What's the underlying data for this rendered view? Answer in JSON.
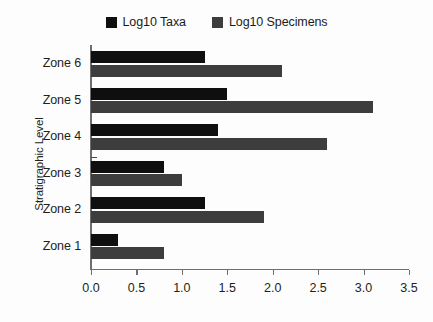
{
  "chart_data": {
    "type": "bar",
    "orientation": "horizontal",
    "title": "",
    "xlabel": "",
    "ylabel": "Stratigraphic Level",
    "xlim": [
      0.0,
      3.5
    ],
    "xticks": [
      "0.0",
      "0.5",
      "1.0",
      "1.5",
      "2.0",
      "2.5",
      "3.0",
      "3.5"
    ],
    "xtick_values": [
      0.0,
      0.5,
      1.0,
      1.5,
      2.0,
      2.5,
      3.0,
      3.5
    ],
    "grid": false,
    "legend_position": "top-center",
    "categories": [
      "Zone 1",
      "Zone 2",
      "Zone 3",
      "Zone 4",
      "Zone 5",
      "Zone 6"
    ],
    "category_order_bottom_to_top": [
      "Zone 1",
      "Zone 2",
      "Zone 3",
      "Zone 4",
      "Zone 5",
      "Zone 6"
    ],
    "series": [
      {
        "name": "Log10 Taxa",
        "color": "#0f0f0f",
        "values": [
          0.3,
          1.25,
          0.8,
          1.4,
          1.5,
          1.25
        ]
      },
      {
        "name": "Log10 Specimens",
        "color": "#3d3d3d",
        "values": [
          0.8,
          1.9,
          1.0,
          2.6,
          3.1,
          2.1
        ]
      }
    ]
  },
  "legend": {
    "entries": [
      {
        "label": "Log10 Taxa",
        "color": "#0f0f0f"
      },
      {
        "label": "Log10 Specimens",
        "color": "#3d3d3d"
      }
    ]
  },
  "axes": {
    "y_title": "Stratigraphic Level"
  }
}
